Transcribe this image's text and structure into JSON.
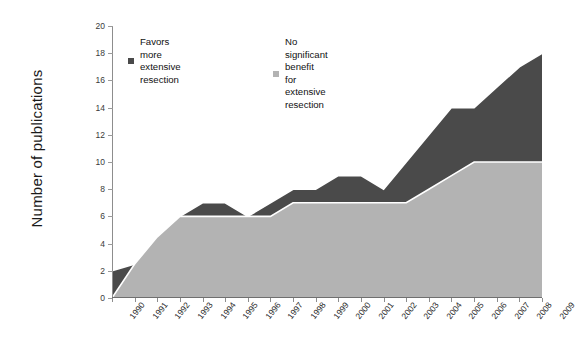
{
  "chart": {
    "ylabel": "Number of publications",
    "y_ticks": [
      0,
      2,
      4,
      6,
      8,
      10,
      12,
      14,
      16,
      18,
      20
    ],
    "legend": {
      "dark_label": "Favors more\nextensive resection",
      "light_label": "No significant benefit\nfor extensive resection",
      "dark_color": "#4a4a4a",
      "light_color": "#b3b3b3"
    }
  },
  "chart_data": {
    "type": "area",
    "title": "",
    "xlabel": "",
    "ylabel": "Number of publications",
    "ylim": [
      0,
      20
    ],
    "grid": false,
    "legend_position": "top-inside",
    "stacked": true,
    "categories": [
      "1990",
      "1991",
      "1992",
      "1993",
      "1994",
      "1995",
      "1996",
      "1997",
      "1998",
      "1999",
      "2000",
      "2001",
      "2002",
      "2003",
      "2004",
      "2005",
      "2006",
      "2007",
      "2008",
      "2009"
    ],
    "series": [
      {
        "name": "No significant benefit for extensive resection",
        "color": "#b3b3b3",
        "values": [
          0,
          2.5,
          4.5,
          6,
          6,
          6,
          6,
          6,
          7,
          7,
          7,
          7,
          7,
          7,
          8,
          9,
          10,
          10,
          10,
          10
        ]
      },
      {
        "name": "Favors more extensive resection",
        "color": "#4a4a4a",
        "values": [
          2,
          0,
          0,
          0,
          1,
          1,
          0,
          1,
          1,
          1,
          2,
          2,
          1,
          3,
          4,
          5,
          4,
          5.5,
          7,
          8
        ]
      }
    ],
    "totals": [
      2,
      2.5,
      4.5,
      6,
      7,
      7,
      6,
      7,
      8,
      8,
      9,
      9,
      8,
      10,
      12,
      14,
      14,
      15.5,
      17,
      18
    ]
  }
}
